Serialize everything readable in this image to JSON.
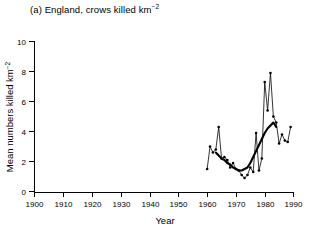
{
  "figure": {
    "panel_label": "(a)",
    "title": "(a) England, crows killed km",
    "title_exponent": "−2",
    "background_color": "#ffffff",
    "ink_color": "#000000"
  },
  "chart_data": {
    "type": "line",
    "xlabel": "Year",
    "ylabel": "Mean numbers killed km⁻²",
    "xlim": [
      1900,
      1990
    ],
    "ylim": [
      0,
      10
    ],
    "xticks": [
      1900,
      1910,
      1920,
      1930,
      1940,
      1950,
      1960,
      1970,
      1980,
      1990
    ],
    "yticks": [
      0,
      2,
      4,
      6,
      8,
      10
    ],
    "xtick_labels": [
      "1900",
      "1910",
      "1920",
      "1930",
      "1940",
      "1950",
      "1960",
      "1970",
      "1980",
      "1990"
    ],
    "ytick_labels": [
      "0",
      "2",
      "4",
      "6",
      "8",
      "10"
    ],
    "grid": false,
    "legend": false,
    "legend_position": "none",
    "series": [
      {
        "name": "Annual mean crows killed per km²",
        "style": "thin-line-with-markers",
        "markers": true,
        "x": [
          1960,
          1961,
          1962,
          1963,
          1964,
          1965,
          1966,
          1967,
          1968,
          1969,
          1970,
          1971,
          1972,
          1973,
          1974,
          1975,
          1976,
          1977,
          1978,
          1979,
          1980,
          1981,
          1982,
          1983,
          1984,
          1985,
          1986,
          1987,
          1988,
          1989
        ],
        "values": [
          1.5,
          3.0,
          2.6,
          2.8,
          4.3,
          2.2,
          2.3,
          2.1,
          1.6,
          1.9,
          1.5,
          1.4,
          1.1,
          0.9,
          1.1,
          1.6,
          1.3,
          3.9,
          1.4,
          2.2,
          7.3,
          5.4,
          7.9,
          5.0,
          4.6,
          3.2,
          3.8,
          3.4,
          3.3,
          4.3
        ]
      },
      {
        "name": "Smoothed trend",
        "style": "thick-line",
        "markers": false,
        "x": [
          1963,
          1964,
          1965,
          1966,
          1967,
          1968,
          1969,
          1970,
          1971,
          1972,
          1973,
          1974,
          1975,
          1976,
          1977,
          1978,
          1979,
          1980,
          1981,
          1982,
          1983,
          1984
        ],
        "values": [
          2.6,
          2.4,
          2.2,
          2.1,
          1.9,
          1.8,
          1.6,
          1.5,
          1.4,
          1.4,
          1.5,
          1.6,
          1.9,
          2.3,
          2.7,
          3.1,
          3.5,
          3.9,
          4.2,
          4.4,
          4.6,
          4.3
        ]
      }
    ]
  },
  "axes": {
    "y_axis_title": "Mean numbers killed km",
    "y_axis_title_exponent": "−2",
    "x_axis_title": "Year"
  }
}
